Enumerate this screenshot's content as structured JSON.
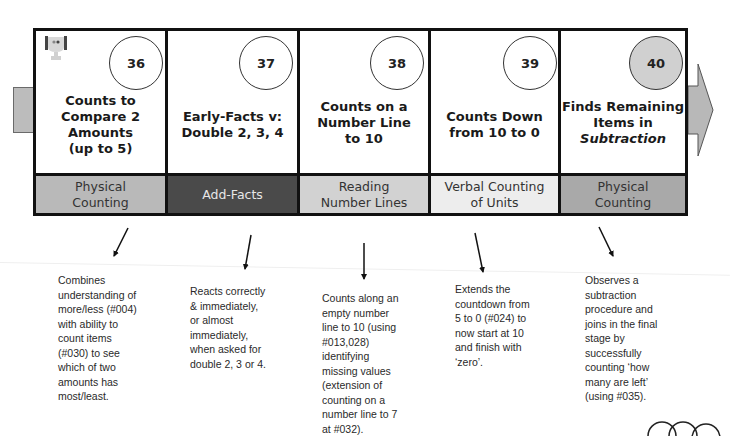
{
  "diagram": {
    "steps": [
      {
        "number": "36",
        "title_lines": [
          "Counts to",
          "Compare 2",
          "Amounts",
          "(up to 5)"
        ],
        "category": "Physical Counting",
        "category_lines": [
          "Physical",
          "Counting"
        ],
        "category_color": "#b9b9b9",
        "category_text_color": "#333333",
        "circle_fill": "#ffffff",
        "has_trophy_icon": true,
        "description_lines": [
          "Combines",
          "understanding of",
          "more/less (#004)",
          "with ability to",
          "count items",
          "(#030) to see",
          "which of two",
          "amounts has",
          "most/least."
        ]
      },
      {
        "number": "37",
        "title_lines": [
          "Early-Facts v:",
          "Double 2, 3, 4"
        ],
        "category": "Add-Facts",
        "category_lines": [
          "Add-Facts"
        ],
        "category_color": "#4a4a4a",
        "category_text_color": "#e6e6e6",
        "circle_fill": "#ffffff",
        "description_lines": [
          "Reacts correctly",
          "& immediately,",
          "or almost",
          "immediately,",
          "when asked for",
          "double 2, 3 or 4."
        ]
      },
      {
        "number": "38",
        "title_lines": [
          "Counts on a",
          "Number Line",
          "to 10"
        ],
        "category": "Reading Number Lines",
        "category_lines": [
          "Reading",
          "Number Lines"
        ],
        "category_color": "#d2d2d2",
        "category_text_color": "#333333",
        "circle_fill": "#ffffff",
        "description_lines": [
          "Counts along an",
          "empty number",
          "line to 10 (using",
          "#013,028)",
          "identifying",
          "missing values",
          "(extension of",
          "counting on a",
          "number line to 7",
          "at #032)."
        ]
      },
      {
        "number": "39",
        "title_lines": [
          "Counts Down",
          "from 10 to 0"
        ],
        "category": "Verbal Counting of Units",
        "category_lines": [
          "Verbal Counting",
          "of Units"
        ],
        "category_color": "#ededed",
        "category_text_color": "#333333",
        "circle_fill": "#ffffff",
        "description_lines": [
          "Extends the",
          "countdown from",
          "5 to 0 (#024) to",
          "now start at 10",
          "and finish with",
          "‘zero’."
        ]
      },
      {
        "number": "40",
        "title_lines": [
          "Finds Remaining",
          "Items in"
        ],
        "title_italic_line": "Subtraction",
        "category": "Physical Counting",
        "category_lines": [
          "Physical",
          "Counting"
        ],
        "category_color": "#a9a9a9",
        "category_text_color": "#333333",
        "circle_fill": "#d0d0d0",
        "description_lines": [
          "Observes a",
          "subtraction",
          "procedure and",
          "joins in the final",
          "stage by",
          "successfully",
          "counting ‘how",
          "many are left’",
          "(using #035)."
        ]
      }
    ],
    "icons": {
      "trophy": "trophy-icon",
      "next_arrow": "right-arrow-icon",
      "prev_stub": "left-connector-stub",
      "pager": "partial-circles"
    },
    "colors": {
      "border": "#111111",
      "arrow_fill": "#b8b8b8",
      "arrow_stroke": "#555555"
    }
  }
}
